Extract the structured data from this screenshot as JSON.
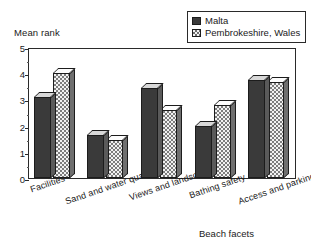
{
  "chart_data": {
    "type": "bar",
    "title": "",
    "xlabel": "Beach facets",
    "ylabel": "Mean rank",
    "ylim": [
      0,
      5
    ],
    "ytick_labels": [
      "0",
      "1",
      "2",
      "3",
      "4",
      "5"
    ],
    "ytick_values": [
      0,
      1,
      2,
      3,
      4,
      5
    ],
    "minor_ticks": true,
    "grid": false,
    "legend_position": "top-right",
    "categories": [
      "Facilities",
      "Sand and water quality",
      "Views and landscape",
      "Bathing safety",
      "Access and parking"
    ],
    "series": [
      {
        "name": "Malta",
        "color": "#3a3a3a",
        "pattern": "solid",
        "values": [
          3.1,
          1.65,
          3.45,
          2.0,
          3.75
        ]
      },
      {
        "name": "Pembrokeshire, Wales",
        "color": "#f2f2f2",
        "pattern": "checker",
        "values": [
          4.0,
          1.45,
          2.6,
          2.8,
          3.65
        ]
      }
    ]
  },
  "legend": {
    "items": [
      {
        "label": "Malta",
        "swatch": "solid-dark-swatch"
      },
      {
        "label": "Pembrokeshire, Wales",
        "swatch": "checker-swatch"
      }
    ]
  },
  "axes": {
    "y_title": "Mean rank",
    "x_title": "Beach facets"
  }
}
